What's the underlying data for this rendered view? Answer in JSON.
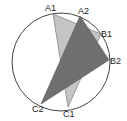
{
  "diagram": {
    "circle": {
      "cx": 61,
      "cy": 62,
      "r": 49,
      "stroke": "#444444"
    },
    "triangles": [
      {
        "name": "A1B1C1",
        "fill": "#c4c4c4",
        "points": {
          "A1": [
            53,
            14
          ],
          "B1": [
            101,
            34
          ],
          "C1": [
            68,
            107
          ]
        }
      },
      {
        "name": "A2B2C2",
        "fill": "#6f6f6f",
        "points": {
          "A2": [
            80,
            16
          ],
          "B2": [
            109,
            60
          ],
          "C2": [
            41,
            104
          ]
        }
      }
    ],
    "labels": [
      {
        "text": "A1",
        "x": 45,
        "y": 11
      },
      {
        "text": "A2",
        "x": 78,
        "y": 14
      },
      {
        "text": "B1",
        "x": 101,
        "y": 37
      },
      {
        "text": "B2",
        "x": 110,
        "y": 64
      },
      {
        "text": "C1",
        "x": 63,
        "y": 117
      },
      {
        "text": "C2",
        "x": 32,
        "y": 112
      }
    ]
  }
}
